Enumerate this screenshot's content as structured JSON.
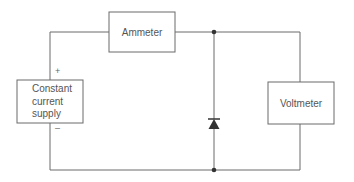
{
  "diagram": {
    "type": "circuit-schematic",
    "components": {
      "ammeter": {
        "label": "Ammeter"
      },
      "voltmeter": {
        "label": "Voltmeter"
      },
      "supply": {
        "label_lines": [
          "Constant",
          "current",
          "supply"
        ]
      },
      "diode": {
        "orientation": "anode-bottom-cathode-top"
      }
    },
    "terminals": {
      "positive": "+",
      "negative": "–"
    },
    "colors": {
      "line": "#6a6a6a",
      "text": "#555555",
      "junction": "#333333"
    }
  }
}
